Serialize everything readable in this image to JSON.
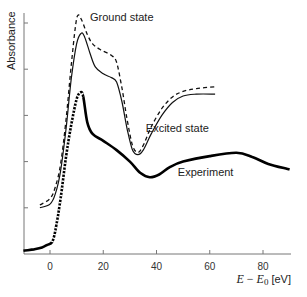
{
  "chart_data": {
    "type": "line",
    "title": "",
    "xlabel": "E − E0 [eV]",
    "xlabel_parts": {
      "e": "E",
      "minus": " − ",
      "e0": "E",
      "sub": "0",
      "unit": " [eV]"
    },
    "ylabel": "Absorbance",
    "xlim": [
      -10,
      90
    ],
    "ylim": [
      0,
      5.2
    ],
    "x_ticks": [
      0,
      20,
      40,
      60,
      80
    ],
    "x_tick_labels": [
      "0",
      "20",
      "40",
      "60",
      "80"
    ],
    "y_ticks": [
      1,
      2,
      3,
      4,
      5
    ],
    "y_tick_labels": [],
    "grid": false,
    "legend": "inline labels",
    "series": [
      {
        "name": "Ground state",
        "style": "dashed",
        "points": [
          [
            -3.8,
            1.06
          ],
          [
            0,
            1.2
          ],
          [
            2,
            1.45
          ],
          [
            4,
            1.95
          ],
          [
            6,
            2.9
          ],
          [
            8,
            4.1
          ],
          [
            9.5,
            4.9
          ],
          [
            10.5,
            5.17
          ],
          [
            12,
            5.05
          ],
          [
            14,
            4.75
          ],
          [
            16,
            4.55
          ],
          [
            19,
            4.42
          ],
          [
            23,
            4.3
          ],
          [
            25,
            4.15
          ],
          [
            27,
            3.6
          ],
          [
            29,
            2.9
          ],
          [
            31,
            2.35
          ],
          [
            33,
            2.2
          ],
          [
            35,
            2.35
          ],
          [
            38,
            2.75
          ],
          [
            42,
            3.15
          ],
          [
            46,
            3.4
          ],
          [
            50,
            3.52
          ],
          [
            55,
            3.58
          ],
          [
            62,
            3.62
          ]
        ]
      },
      {
        "name": "Excited state",
        "style": "solid",
        "points": [
          [
            -3.8,
            1.0
          ],
          [
            0,
            1.08
          ],
          [
            2,
            1.3
          ],
          [
            4,
            1.8
          ],
          [
            6,
            2.7
          ],
          [
            8,
            3.8
          ],
          [
            10,
            4.55
          ],
          [
            11.7,
            4.78
          ],
          [
            13,
            4.7
          ],
          [
            15,
            4.35
          ],
          [
            17,
            4.05
          ],
          [
            20,
            3.9
          ],
          [
            23,
            3.82
          ],
          [
            25,
            3.72
          ],
          [
            27,
            3.3
          ],
          [
            29,
            2.7
          ],
          [
            31,
            2.25
          ],
          [
            33,
            2.15
          ],
          [
            35,
            2.25
          ],
          [
            38,
            2.6
          ],
          [
            42,
            3.0
          ],
          [
            46,
            3.28
          ],
          [
            50,
            3.42
          ],
          [
            55,
            3.46
          ],
          [
            62,
            3.46
          ]
        ]
      },
      {
        "name": "Experiment",
        "style": "thick",
        "points": [
          [
            -10,
            0.07
          ],
          [
            -6,
            0.1
          ],
          [
            -3,
            0.14
          ],
          [
            -1,
            0.2
          ],
          [
            0.8,
            0.26
          ],
          [
            2,
            0.5
          ],
          [
            4,
            1.2
          ],
          [
            6,
            2.1
          ],
          [
            8,
            2.8
          ],
          [
            10,
            3.35
          ],
          [
            11.5,
            3.5
          ],
          [
            12.5,
            3.4
          ],
          [
            14,
            2.85
          ],
          [
            16,
            2.6
          ],
          [
            20,
            2.45
          ],
          [
            25,
            2.25
          ],
          [
            30,
            2.0
          ],
          [
            34,
            1.75
          ],
          [
            37.5,
            1.66
          ],
          [
            41,
            1.72
          ],
          [
            45,
            1.88
          ],
          [
            50,
            2.0
          ],
          [
            60,
            2.12
          ],
          [
            70,
            2.19
          ],
          [
            76,
            2.1
          ],
          [
            82,
            1.95
          ],
          [
            90,
            1.83
          ]
        ]
      }
    ],
    "annotations": [
      {
        "text": "Ground state",
        "x": 15,
        "y": 5.05
      },
      {
        "text": "Excited state",
        "x": 36,
        "y": 2.65
      },
      {
        "text": "Experiment",
        "x": 48,
        "y": 1.68
      }
    ]
  }
}
